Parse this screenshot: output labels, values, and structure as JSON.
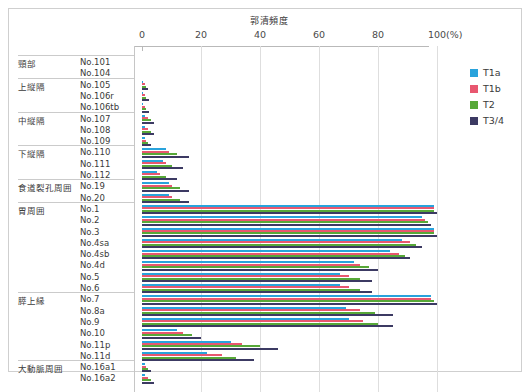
{
  "chart_title": "郭清頻度",
  "unit_label": "(%)",
  "legend": {
    "position": "right",
    "items": [
      {
        "label": "T1a",
        "color": "#29a3dc"
      },
      {
        "label": "T1b",
        "color": "#e8576f"
      },
      {
        "label": "T2",
        "color": "#57a838"
      },
      {
        "label": "T3/4",
        "color": "#3c3a63"
      }
    ]
  },
  "chart_data": {
    "type": "bar",
    "orientation": "horizontal",
    "title": "郭清頻度",
    "xlabel": "(%)",
    "ylabel": "",
    "xlim": [
      0,
      100
    ],
    "xticks": [
      0,
      20,
      40,
      60,
      80,
      100
    ],
    "grid": true,
    "categories": [
      "No.101",
      "No.104",
      "No.105",
      "No.106r",
      "No.106tb",
      "No.107",
      "No.108",
      "No.109",
      "No.110",
      "No.111",
      "No.112",
      "No.19",
      "No.20",
      "No.1",
      "No.2",
      "No.3",
      "No.4sa",
      "No.4sb",
      "No.4d",
      "No.5",
      "No.6",
      "No.7",
      "No.8a",
      "No.9",
      "No.10",
      "No.11p",
      "No.11d",
      "No.16a1",
      "No.16a2"
    ],
    "groups": [
      {
        "label": "頸部",
        "categories": [
          "No.101",
          "No.104"
        ]
      },
      {
        "label": "上縦隔",
        "categories": [
          "No.105",
          "No.106r",
          "No.106tb"
        ]
      },
      {
        "label": "中縦隔",
        "categories": [
          "No.107",
          "No.108",
          "No.109"
        ]
      },
      {
        "label": "下縦隔",
        "categories": [
          "No.110",
          "No.111",
          "No.112"
        ]
      },
      {
        "label": "食道裂孔周囲",
        "categories": [
          "No.19",
          "No.20"
        ]
      },
      {
        "label": "胃周囲",
        "categories": [
          "No.1",
          "No.2",
          "No.3",
          "No.4sa",
          "No.4sb",
          "No.4d",
          "No.5",
          "No.6"
        ]
      },
      {
        "label": "膵上縁",
        "categories": [
          "No.7",
          "No.8a",
          "No.9",
          "No.10",
          "No.11p",
          "No.11d"
        ]
      },
      {
        "label": "大動脈周囲",
        "categories": [
          "No.16a1",
          "No.16a2"
        ]
      }
    ],
    "series": [
      {
        "name": "T1a",
        "color": "#29a3dc",
        "values": [
          0,
          0,
          0.5,
          0.5,
          0.5,
          1,
          1,
          1,
          8,
          7,
          5,
          9,
          9,
          99,
          95,
          99,
          88,
          84,
          72,
          67,
          67,
          98,
          69,
          70,
          12,
          30,
          22,
          1,
          1
        ]
      },
      {
        "name": "T1b",
        "color": "#e8576f",
        "values": [
          0,
          0,
          1,
          1,
          1,
          2,
          2,
          1.5,
          9,
          8,
          6,
          10,
          10,
          99,
          96,
          99,
          91,
          87,
          74,
          70,
          70,
          98,
          74,
          75,
          14,
          34,
          27,
          1.5,
          2
        ]
      },
      {
        "name": "T2",
        "color": "#57a838",
        "values": [
          0,
          0,
          1.5,
          1.5,
          1.5,
          3,
          3,
          2,
          12,
          10,
          8,
          13,
          13,
          99,
          97,
          99,
          93,
          89,
          77,
          74,
          74,
          99,
          79,
          80,
          17,
          40,
          32,
          2,
          3
        ]
      },
      {
        "name": "T3/4",
        "color": "#3c3a63",
        "values": [
          0,
          0,
          2,
          2.5,
          2.5,
          4,
          4,
          3,
          16,
          14,
          12,
          16,
          16,
          100,
          98,
          100,
          95,
          91,
          80,
          78,
          78,
          100,
          85,
          85,
          20,
          46,
          38,
          3,
          4
        ]
      }
    ]
  }
}
